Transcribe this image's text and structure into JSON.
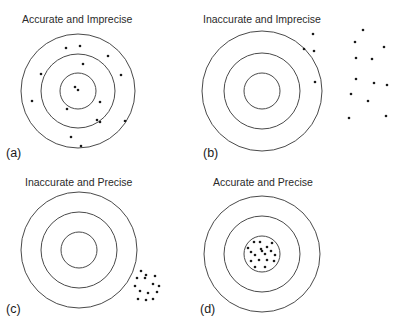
{
  "figure": {
    "panels": [
      {
        "id": "a",
        "label": "(a)",
        "title": "Accurate and Imprecise",
        "accuracy": "accurate",
        "precision": "imprecise",
        "rings": 3,
        "shots": [
          [
            -12,
            -43
          ],
          [
            2,
            -45
          ],
          [
            30,
            -35
          ],
          [
            5,
            -27
          ],
          [
            -37,
            -17
          ],
          [
            43,
            -16
          ],
          [
            -3,
            -4
          ],
          [
            0,
            -1
          ],
          [
            -46,
            10
          ],
          [
            22,
            11
          ],
          [
            -11,
            18
          ],
          [
            19,
            29
          ],
          [
            22,
            31
          ],
          [
            47,
            30
          ],
          [
            -7,
            46
          ],
          [
            3,
            55
          ]
        ]
      },
      {
        "id": "b",
        "label": "(b)",
        "title": "Inaccurate and Imprecise",
        "accuracy": "inaccurate",
        "precision": "imprecise",
        "rings": 3,
        "shots": [
          [
            51,
            -57
          ],
          [
            42,
            -42
          ],
          [
            52,
            -40
          ],
          [
            101,
            -61
          ],
          [
            93,
            -49
          ],
          [
            122,
            -44
          ],
          [
            94,
            -33
          ],
          [
            110,
            -32
          ],
          [
            53,
            -9
          ],
          [
            94,
            -12
          ],
          [
            112,
            -8
          ],
          [
            125,
            -6
          ],
          [
            89,
            3
          ],
          [
            106,
            10
          ],
          [
            87,
            27
          ],
          [
            124,
            25
          ]
        ]
      },
      {
        "id": "c",
        "label": "(c)",
        "title": "Inaccurate and Precise",
        "accuracy": "inaccurate",
        "precision": "precise",
        "rings": 3,
        "shots": [
          [
            62,
            21
          ],
          [
            67,
            25
          ],
          [
            58,
            28
          ],
          [
            66,
            28
          ],
          [
            76,
            26
          ],
          [
            56,
            36
          ],
          [
            74,
            34
          ],
          [
            80,
            36
          ],
          [
            61,
            41
          ],
          [
            69,
            43
          ],
          [
            78,
            42
          ],
          [
            59,
            49
          ],
          [
            67,
            50
          ],
          [
            74,
            49
          ]
        ]
      },
      {
        "id": "d",
        "label": "(d)",
        "title": "Accurate and Precise",
        "accuracy": "accurate",
        "precision": "precise",
        "rings": 3,
        "shots": [
          [
            -8,
            -12
          ],
          [
            -2,
            -12
          ],
          [
            10,
            -11
          ],
          [
            -14,
            -6
          ],
          [
            -1,
            -5
          ],
          [
            5,
            -7
          ],
          [
            -11,
            -2
          ],
          [
            0,
            -3
          ],
          [
            9,
            -3
          ],
          [
            -7,
            1
          ],
          [
            3,
            0
          ],
          [
            13,
            1
          ],
          [
            -11,
            7
          ],
          [
            -3,
            6
          ],
          [
            5,
            6
          ],
          [
            12,
            7
          ],
          [
            -7,
            13
          ],
          [
            3,
            13
          ]
        ]
      }
    ]
  }
}
